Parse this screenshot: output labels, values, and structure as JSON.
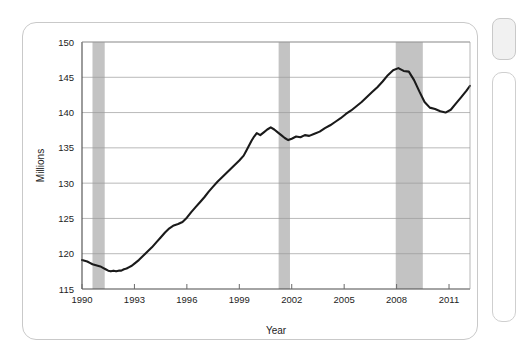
{
  "chart_data": {
    "type": "line",
    "title": "",
    "xlabel": "Year",
    "ylabel": "Millions",
    "xlim": [
      1990.0,
      2012.2
    ],
    "ylim": [
      115,
      150
    ],
    "grid": true,
    "legend": "none",
    "y_ticks": [
      115,
      120,
      125,
      130,
      135,
      140,
      145,
      150
    ],
    "x_ticks": [
      1990,
      1993,
      1996,
      1999,
      2002,
      2005,
      2008,
      2011
    ],
    "series": [
      {
        "name": "Employment",
        "color": "#1a1a1a",
        "x": [
          1990.0,
          1990.15,
          1990.3,
          1990.45,
          1990.6,
          1990.75,
          1990.9,
          1991.05,
          1991.2,
          1991.35,
          1991.5,
          1991.65,
          1991.8,
          1991.95,
          1992.1,
          1992.25,
          1992.4,
          1992.55,
          1992.7,
          1992.85,
          1993.0,
          1993.25,
          1993.5,
          1993.75,
          1994.0,
          1994.25,
          1994.5,
          1994.75,
          1995.0,
          1995.25,
          1995.5,
          1995.75,
          1996.0,
          1996.25,
          1996.5,
          1996.75,
          1997.0,
          1997.25,
          1997.5,
          1997.75,
          1998.0,
          1998.25,
          1998.5,
          1998.75,
          1999.0,
          1999.25,
          1999.4,
          1999.55,
          1999.7,
          1999.85,
          2000.0,
          2000.2,
          2000.4,
          2000.6,
          2000.8,
          2001.0,
          2001.2,
          2001.4,
          2001.6,
          2001.8,
          2002.0,
          2002.25,
          2002.5,
          2002.75,
          2003.0,
          2003.3,
          2003.6,
          2003.9,
          2004.2,
          2004.5,
          2004.8,
          2005.1,
          2005.4,
          2005.7,
          2006.0,
          2006.3,
          2006.6,
          2006.9,
          2007.2,
          2007.5,
          2007.8,
          2008.1,
          2008.4,
          2008.7,
          2009.0,
          2009.3,
          2009.6,
          2009.9,
          2010.2,
          2010.5,
          2010.8,
          2011.1,
          2011.4,
          2011.7,
          2012.0,
          2012.2
        ],
        "y": [
          119.1,
          119.0,
          118.9,
          118.7,
          118.5,
          118.4,
          118.3,
          118.2,
          118.0,
          117.8,
          117.6,
          117.5,
          117.6,
          117.5,
          117.6,
          117.6,
          117.8,
          117.9,
          118.1,
          118.3,
          118.6,
          119.1,
          119.7,
          120.3,
          120.9,
          121.6,
          122.3,
          123.0,
          123.6,
          124.0,
          124.2,
          124.5,
          125.1,
          125.9,
          126.6,
          127.3,
          128.0,
          128.8,
          129.5,
          130.2,
          130.8,
          131.4,
          132.0,
          132.6,
          133.2,
          133.9,
          134.6,
          135.3,
          136.0,
          136.6,
          137.1,
          136.8,
          137.2,
          137.6,
          137.9,
          137.6,
          137.2,
          136.8,
          136.4,
          136.1,
          136.3,
          136.6,
          136.5,
          136.8,
          136.7,
          137.0,
          137.3,
          137.8,
          138.2,
          138.7,
          139.2,
          139.8,
          140.3,
          140.9,
          141.5,
          142.2,
          142.9,
          143.6,
          144.4,
          145.3,
          146.0,
          146.3,
          145.9,
          145.8,
          144.6,
          143.0,
          141.5,
          140.7,
          140.5,
          140.2,
          140.0,
          140.4,
          141.3,
          142.2,
          143.1,
          143.8
        ]
      }
    ],
    "shaded_regions": [
      {
        "label": "recession-1990-1991",
        "x0": 1990.6,
        "x1": 1991.3,
        "color": "#b8b8b8"
      },
      {
        "label": "recession-2001",
        "x0": 2001.25,
        "x1": 2001.9,
        "color": "#b8b8b8"
      },
      {
        "label": "recession-2007-2009",
        "x0": 2007.95,
        "x1": 2009.5,
        "color": "#b8b8b8"
      }
    ]
  },
  "axes": {
    "y_title": "Millions",
    "x_title": "Year",
    "y_tick_labels": [
      "115",
      "120",
      "125",
      "130",
      "135",
      "140",
      "145",
      "150"
    ],
    "x_tick_labels": [
      "1990",
      "1993",
      "1996",
      "1999",
      "2002",
      "2005",
      "2008",
      "2011"
    ]
  }
}
